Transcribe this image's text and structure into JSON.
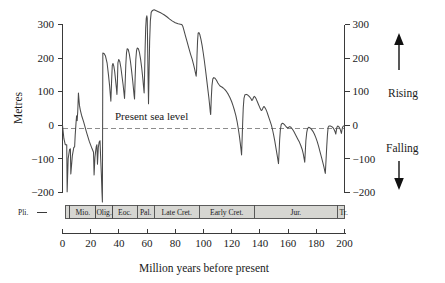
{
  "figure": {
    "xlabel": "Million years before present",
    "ylabel": "Metres",
    "sea_level_note": "Present sea level",
    "rising_label": "Rising",
    "falling_label": "Falling"
  },
  "chart_data": {
    "type": "line",
    "title": "",
    "xlabel": "Million years before present",
    "ylabel": "Metres",
    "xlim": [
      0,
      200
    ],
    "ylim": [
      -230,
      345
    ],
    "x_ticks": [
      0,
      20,
      40,
      60,
      80,
      100,
      120,
      140,
      160,
      180,
      200
    ],
    "y_ticks": [
      -200,
      -100,
      0,
      100,
      200,
      300
    ],
    "y_ticks_right": [
      -200,
      -100,
      0,
      100,
      200,
      300
    ],
    "x_axis_inverted": false,
    "grid": false,
    "legend": null,
    "annotations": [
      {
        "text": "Present sea level",
        "x": 22,
        "y": 25
      },
      {
        "text": "Rising",
        "x": 208,
        "y": 110
      },
      {
        "text": "Falling",
        "x": 208,
        "y": -75
      }
    ],
    "reference_lines": [
      {
        "y": 0,
        "style": "dashed",
        "label": "Present sea level"
      }
    ],
    "axis_direction_markers": [
      {
        "label": "Rising",
        "direction": "up"
      },
      {
        "label": "Falling",
        "direction": "down"
      }
    ],
    "series": [
      {
        "name": "Global sea level (eustatic curve)",
        "units": "metres relative to present sea level",
        "points": [
          [
            0,
            0
          ],
          [
            1,
            -40
          ],
          [
            2,
            -58
          ],
          [
            3,
            -58
          ],
          [
            3.3,
            -198
          ],
          [
            4,
            -100
          ],
          [
            5,
            -72
          ],
          [
            5.6,
            -70
          ],
          [
            5.9,
            -145
          ],
          [
            7,
            -90
          ],
          [
            8,
            -66
          ],
          [
            8.6,
            -64
          ],
          [
            9,
            -30
          ],
          [
            9.6,
            8
          ],
          [
            10,
            28
          ],
          [
            10.4,
            14
          ],
          [
            10.8,
            40
          ],
          [
            11.3,
            96
          ],
          [
            12,
            60
          ],
          [
            12.6,
            46
          ],
          [
            13.5,
            30
          ],
          [
            15,
            10
          ],
          [
            17,
            -20
          ],
          [
            19,
            -48
          ],
          [
            21,
            -70
          ],
          [
            22,
            -80
          ],
          [
            22.4,
            -148
          ],
          [
            23,
            -96
          ],
          [
            23.6,
            -74
          ],
          [
            24,
            -62
          ],
          [
            24.4,
            -58
          ],
          [
            24.8,
            -116
          ],
          [
            25.4,
            -66
          ],
          [
            26,
            -50
          ],
          [
            26.6,
            -46
          ],
          [
            27,
            -90
          ],
          [
            27.6,
            -150
          ],
          [
            28,
            -200
          ],
          [
            28.3,
            -228
          ],
          [
            28.6,
            215
          ],
          [
            29.5,
            214
          ],
          [
            30.5,
            206
          ],
          [
            31.6,
            186
          ],
          [
            32.6,
            150
          ],
          [
            33.4,
            118
          ],
          [
            34,
            86
          ],
          [
            34.3,
            72
          ],
          [
            34.8,
            130
          ],
          [
            35.3,
            178
          ],
          [
            35.8,
            184
          ],
          [
            36.4,
            176
          ],
          [
            37,
            160
          ],
          [
            37.6,
            136
          ],
          [
            38.2,
            112
          ],
          [
            38.6,
            92
          ],
          [
            38.9,
            122
          ],
          [
            39.3,
            186
          ],
          [
            39.9,
            196
          ],
          [
            40.6,
            190
          ],
          [
            41.4,
            172
          ],
          [
            42.2,
            146
          ],
          [
            43,
            120
          ],
          [
            43.6,
            96
          ],
          [
            44,
            80
          ],
          [
            44.4,
            120
          ],
          [
            44.9,
            180
          ],
          [
            45.4,
            216
          ],
          [
            45.9,
            228
          ],
          [
            46.6,
            226
          ],
          [
            47.4,
            212
          ],
          [
            48.2,
            190
          ],
          [
            49,
            162
          ],
          [
            49.8,
            132
          ],
          [
            50.4,
            106
          ],
          [
            50.8,
            88
          ],
          [
            51.1,
            78
          ],
          [
            51.5,
            140
          ],
          [
            52,
            196
          ],
          [
            52.5,
            222
          ],
          [
            53,
            230
          ],
          [
            53.8,
            228
          ],
          [
            54.6,
            216
          ],
          [
            55.4,
            196
          ],
          [
            56.2,
            170
          ],
          [
            56.9,
            142
          ],
          [
            57.5,
            114
          ],
          [
            57.9,
            96
          ],
          [
            58.2,
            150
          ],
          [
            58.6,
            230
          ],
          [
            59,
            290
          ],
          [
            59.4,
            318
          ],
          [
            59.8,
            326
          ],
          [
            60.1,
            318
          ],
          [
            60.4,
            230
          ],
          [
            60.7,
            140
          ],
          [
            61,
            64
          ],
          [
            61.4,
            160
          ],
          [
            61.8,
            250
          ],
          [
            62.3,
            310
          ],
          [
            62.9,
            336
          ],
          [
            63.8,
            342
          ],
          [
            65,
            344
          ],
          [
            66.5,
            341
          ],
          [
            68,
            338
          ],
          [
            70,
            334
          ],
          [
            72,
            329
          ],
          [
            74,
            323
          ],
          [
            76,
            316
          ],
          [
            78,
            310
          ],
          [
            80,
            305
          ],
          [
            82,
            302
          ],
          [
            83.5,
            301
          ],
          [
            84.6,
            300
          ],
          [
            85.4,
            294
          ],
          [
            86.2,
            282
          ],
          [
            87.2,
            266
          ],
          [
            88.4,
            248
          ],
          [
            89.6,
            230
          ],
          [
            90.8,
            212
          ],
          [
            92,
            196
          ],
          [
            93,
            180
          ],
          [
            93.8,
            166
          ],
          [
            94.4,
            154
          ],
          [
            94.8,
            146
          ],
          [
            95.1,
            164
          ],
          [
            95.4,
            208
          ],
          [
            95.8,
            252
          ],
          [
            96.2,
            274
          ],
          [
            96.7,
            276
          ],
          [
            97.4,
            270
          ],
          [
            98.2,
            256
          ],
          [
            99,
            238
          ],
          [
            99.8,
            216
          ],
          [
            100.6,
            192
          ],
          [
            101.4,
            166
          ],
          [
            102.2,
            138
          ],
          [
            103,
            110
          ],
          [
            103.8,
            82
          ],
          [
            104.4,
            58
          ],
          [
            104.8,
            40
          ],
          [
            105.1,
            32
          ],
          [
            105.5,
            78
          ],
          [
            106,
            118
          ],
          [
            106.6,
            138
          ],
          [
            107.3,
            142
          ],
          [
            108.2,
            140
          ],
          [
            109.2,
            134
          ],
          [
            110.2,
            126
          ],
          [
            111.2,
            120
          ],
          [
            112,
            116
          ],
          [
            113,
            114
          ],
          [
            114,
            111
          ],
          [
            115.2,
            106
          ],
          [
            116.4,
            100
          ],
          [
            117.6,
            92
          ],
          [
            118.8,
            82
          ],
          [
            120,
            70
          ],
          [
            121,
            58
          ],
          [
            122,
            44
          ],
          [
            123,
            28
          ],
          [
            123.8,
            12
          ],
          [
            124.6,
            -8
          ],
          [
            125.4,
            -30
          ],
          [
            126,
            -50
          ],
          [
            126.6,
            -72
          ],
          [
            127,
            -88
          ],
          [
            127.4,
            -40
          ],
          [
            127.8,
            10
          ],
          [
            128.2,
            52
          ],
          [
            128.7,
            80
          ],
          [
            129.4,
            91
          ],
          [
            130.4,
            92
          ],
          [
            131.4,
            90
          ],
          [
            132.4,
            86
          ],
          [
            133.2,
            82
          ],
          [
            133.8,
            78
          ],
          [
            134.3,
            74
          ],
          [
            134.8,
            76
          ],
          [
            135.4,
            82
          ],
          [
            136,
            86
          ],
          [
            136.6,
            84
          ],
          [
            137.4,
            78
          ],
          [
            138.2,
            70
          ],
          [
            139,
            62
          ],
          [
            139.8,
            54
          ],
          [
            140.5,
            48
          ],
          [
            141,
            44
          ],
          [
            141.6,
            46
          ],
          [
            142.2,
            52
          ],
          [
            142.8,
            56
          ],
          [
            143.4,
            54
          ],
          [
            144.2,
            48
          ],
          [
            145,
            40
          ],
          [
            145.8,
            30
          ],
          [
            146.6,
            20
          ],
          [
            147.4,
            10
          ],
          [
            148.2,
            0
          ],
          [
            149,
            -14
          ],
          [
            149.8,
            -30
          ],
          [
            150.6,
            -48
          ],
          [
            151.4,
            -68
          ],
          [
            152.2,
            -88
          ],
          [
            152.8,
            -104
          ],
          [
            153.2,
            -114
          ],
          [
            153.6,
            -80
          ],
          [
            154,
            -44
          ],
          [
            154.5,
            -14
          ],
          [
            155.1,
            2
          ],
          [
            155.8,
            6
          ],
          [
            156.6,
            5
          ],
          [
            157.4,
            2
          ],
          [
            158.2,
            -2
          ],
          [
            159,
            -6
          ],
          [
            159.8,
            -8
          ],
          [
            160.4,
            -6
          ],
          [
            161.2,
            -4
          ],
          [
            162,
            -6
          ],
          [
            163,
            -11
          ],
          [
            164,
            -18
          ],
          [
            165,
            -26
          ],
          [
            166,
            -34
          ],
          [
            167,
            -42
          ],
          [
            168,
            -50
          ],
          [
            169,
            -60
          ],
          [
            170,
            -72
          ],
          [
            170.8,
            -86
          ],
          [
            171.4,
            -100
          ],
          [
            171.8,
            -110
          ],
          [
            172.2,
            -78
          ],
          [
            172.6,
            -46
          ],
          [
            173.2,
            -22
          ],
          [
            173.8,
            -10
          ],
          [
            174.6,
            -6
          ],
          [
            175.6,
            -8
          ],
          [
            176.6,
            -12
          ],
          [
            177.6,
            -18
          ],
          [
            178.6,
            -26
          ],
          [
            179.6,
            -36
          ],
          [
            180.6,
            -48
          ],
          [
            181.6,
            -62
          ],
          [
            182.6,
            -78
          ],
          [
            183.6,
            -94
          ],
          [
            184.6,
            -110
          ],
          [
            185.4,
            -124
          ],
          [
            186,
            -136
          ],
          [
            186.4,
            -143
          ],
          [
            186.9,
            -104
          ],
          [
            187.4,
            -64
          ],
          [
            187.9,
            -28
          ],
          [
            188.4,
            -6
          ],
          [
            189,
            -2
          ],
          [
            190,
            -2
          ],
          [
            191,
            -4
          ],
          [
            192,
            -8
          ],
          [
            192.8,
            -14
          ],
          [
            193.4,
            -20
          ],
          [
            193.8,
            -26
          ],
          [
            194.2,
            -16
          ],
          [
            194.6,
            -6
          ],
          [
            195.2,
            -2
          ],
          [
            196,
            -4
          ],
          [
            196.8,
            -10
          ],
          [
            197.4,
            -18
          ],
          [
            197.8,
            -24
          ],
          [
            198.2,
            -14
          ],
          [
            198.6,
            -6
          ],
          [
            199.2,
            -2
          ],
          [
            200,
            -2
          ]
        ]
      }
    ]
  },
  "timescale": {
    "periods": [
      {
        "label": "Pli.",
        "start": -12,
        "end": 2,
        "outside_left": true
      },
      {
        "label": "",
        "start": 2,
        "end": 5.3,
        "narrow": true
      },
      {
        "label": "Mio.",
        "start": 5.3,
        "end": 23.5
      },
      {
        "label": "Olig.",
        "start": 23.5,
        "end": 35.5
      },
      {
        "label": "Eoc.",
        "start": 35.5,
        "end": 53
      },
      {
        "label": "Pal.",
        "start": 53,
        "end": 65
      },
      {
        "label": "Late Cret.",
        "start": 65,
        "end": 97
      },
      {
        "label": "Early Cret.",
        "start": 97,
        "end": 136
      },
      {
        "label": "Jur.",
        "start": 136,
        "end": 195
      },
      {
        "label": "Tr.",
        "start": 195,
        "end": 208,
        "outside_right": true
      }
    ]
  },
  "colors": {
    "curve": "#4a4a4a",
    "axis": "#3a3a3a",
    "zero_line": "#8d8d8d",
    "period_fill": "#d6d6d2",
    "text": "#1a1a1a"
  }
}
